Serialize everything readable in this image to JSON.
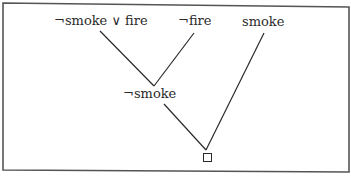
{
  "diagram": {
    "type": "resolution-refutation-tree",
    "nodes": {
      "premise1": "¬smoke ∨ fire",
      "premise2": "¬fire",
      "premise3": "smoke",
      "resolvent": "¬smoke",
      "empty_clause": "□"
    },
    "edges": [
      {
        "from": "premise1",
        "to": "resolvent"
      },
      {
        "from": "premise2",
        "to": "resolvent"
      },
      {
        "from": "resolvent",
        "to": "empty_clause"
      },
      {
        "from": "premise3",
        "to": "empty_clause"
      }
    ],
    "colors": {
      "ink": "#2a2a2a",
      "border": "#555555",
      "background": "#ffffff"
    }
  }
}
